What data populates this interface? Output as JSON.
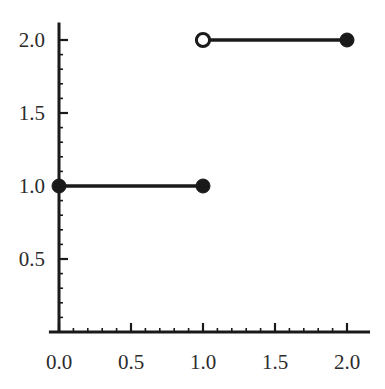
{
  "chart_data": {
    "type": "line",
    "title": "",
    "xlabel": "",
    "ylabel": "",
    "xlim": [
      -0.07,
      2.16
    ],
    "ylim": [
      -0.08,
      2.12
    ],
    "grid": false,
    "legend": null,
    "x_ticks": [
      0.0,
      0.5,
      1.0,
      1.5,
      2.0
    ],
    "x_tick_labels": [
      "0.0",
      "0.5",
      "1.0",
      "1.5",
      "2.0"
    ],
    "y_ticks": [
      0.5,
      1.0,
      1.5,
      2.0
    ],
    "y_tick_labels": [
      "0.5",
      "1.0",
      "1.5",
      "2.0"
    ],
    "x_minor_tick_step": 0.1,
    "y_minor_tick_step": 0.1,
    "line_color": "#1a1a1a",
    "text_color": "#2b2b2b",
    "axis_color": "#1a1a1a",
    "segments": [
      {
        "name": "lower-step",
        "x_start": 0.0,
        "x_end": 1.0,
        "y": 1.0,
        "start_marker": "filled",
        "end_marker": "filled"
      },
      {
        "name": "upper-step",
        "x_start": 1.0,
        "x_end": 2.0,
        "y": 2.0,
        "start_marker": "open",
        "end_marker": "filled"
      }
    ],
    "points": [
      {
        "name": "point-0-1-filled",
        "x": 0.0,
        "y": 1.0,
        "style": "filled"
      },
      {
        "name": "point-1-1-filled",
        "x": 1.0,
        "y": 1.0,
        "style": "filled"
      },
      {
        "name": "point-1-2-open",
        "x": 1.0,
        "y": 2.0,
        "style": "open"
      },
      {
        "name": "point-2-2-filled",
        "x": 2.0,
        "y": 2.0,
        "style": "filled"
      }
    ]
  }
}
